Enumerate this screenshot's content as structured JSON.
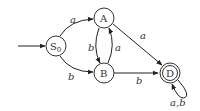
{
  "diagram": {
    "type": "finite-automaton",
    "states": [
      {
        "id": "S0",
        "label": "S",
        "subscript": "0",
        "start": true,
        "accepting": false
      },
      {
        "id": "A",
        "label": "A",
        "start": false,
        "accepting": false
      },
      {
        "id": "B",
        "label": "B",
        "start": false,
        "accepting": false
      },
      {
        "id": "D",
        "label": "D",
        "start": false,
        "accepting": true
      }
    ],
    "transitions": [
      {
        "from": "S0",
        "to": "A",
        "label": "a"
      },
      {
        "from": "S0",
        "to": "B",
        "label": "b"
      },
      {
        "from": "A",
        "to": "B",
        "label": "b"
      },
      {
        "from": "B",
        "to": "A",
        "label": "a"
      },
      {
        "from": "A",
        "to": "D",
        "label": "a"
      },
      {
        "from": "B",
        "to": "D",
        "label": "b"
      },
      {
        "from": "D",
        "to": "D",
        "label": "a,b"
      }
    ]
  }
}
